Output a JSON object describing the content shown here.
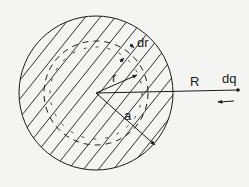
{
  "diagram": {
    "labels": {
      "shell_thickness": "dr",
      "shell_radius": "r",
      "sphere_radius": "a",
      "distance": "R",
      "charge": "dq"
    },
    "colors": {
      "background": "#f4f4f2",
      "ink": "#1a1a1a"
    }
  }
}
